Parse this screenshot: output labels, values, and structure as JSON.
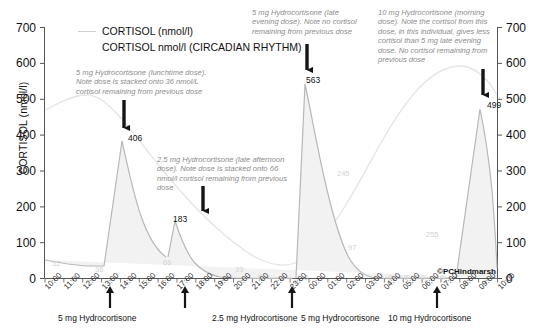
{
  "chart_data": {
    "type": "area",
    "title": "",
    "xlabel": "",
    "ylabel": "CORTISOL (nmol/l)",
    "ylim": [
      0,
      700
    ],
    "yticks": [
      0,
      100,
      200,
      300,
      400,
      500,
      600,
      700
    ],
    "yticks_right": [
      0,
      100,
      200,
      300,
      400,
      500,
      600,
      700
    ],
    "grid": false,
    "legend_position": "top-left",
    "x": [
      "10:00",
      "11:00",
      "12:00",
      "13:00",
      "14:00",
      "15:00",
      "16:00",
      "17:00",
      "18:00",
      "19:00",
      "20:00",
      "21:00",
      "22:00",
      "23:00",
      "00:00",
      "01:00",
      "02:00",
      "03:00",
      "04:00",
      "05:00",
      "06:00",
      "07:00",
      "08:00",
      "09:00",
      "10:00"
    ],
    "series": [
      {
        "name": "CORTISOL (nmol/l)",
        "color": "#bfbfbf",
        "fill": "#f0f0f0",
        "values": [
          52,
          40,
          36,
          36,
          406,
          230,
          130,
          66,
          183,
          120,
          70,
          33,
          10,
          0,
          563,
          330,
          245,
          97,
          20,
          0,
          0,
          0,
          499,
          300,
          180
        ]
      },
      {
        "name": "CORTISOL nmol/l (CIRCADIAN RHYTHM)",
        "color": "#e2e2e2",
        "values": [
          330,
          360,
          390,
          380,
          340,
          300,
          250,
          205,
          170,
          140,
          110,
          85,
          62,
          45,
          35,
          40,
          70,
          120,
          200,
          290,
          370,
          420,
          430,
          400,
          340
        ]
      }
    ],
    "point_labels": [
      {
        "value": "52",
        "x": 52,
        "y": 259
      },
      {
        "value": "36",
        "x": 95,
        "y": 265
      },
      {
        "value": "406",
        "x": 128,
        "y": 133
      },
      {
        "value": "66",
        "x": 163,
        "y": 258
      },
      {
        "value": "183",
        "x": 173,
        "y": 214
      },
      {
        "value": "33",
        "x": 235,
        "y": 265
      },
      {
        "value": "0",
        "x": 258,
        "y": 273
      },
      {
        "value": "0",
        "x": 281,
        "y": 273
      },
      {
        "value": "0",
        "x": 304,
        "y": 273
      },
      {
        "value": "563",
        "x": 306,
        "y": 75
      },
      {
        "value": "245",
        "x": 337,
        "y": 169
      },
      {
        "value": "97",
        "x": 348,
        "y": 243
      },
      {
        "value": "0",
        "x": 388,
        "y": 273
      },
      {
        "value": "0",
        "x": 404,
        "y": 273
      },
      {
        "value": "0",
        "x": 421,
        "y": 273
      },
      {
        "value": "255",
        "x": 426,
        "y": 230
      },
      {
        "value": "0",
        "x": 440,
        "y": 273
      },
      {
        "value": "499",
        "x": 487,
        "y": 100
      }
    ],
    "annotations": [
      {
        "id": "lunchtime",
        "text": "5 mg Hydrocortisone (lunchtime dose).\nNote dose is stacked onto 36 nmol/L\ncortisol remaining from previous dose"
      },
      {
        "id": "late-afternoon",
        "text": "2.5 mg Hydrocortisone (late afternoon\ndose). Note dose is stacked onto 66\nnmol/l cortisol remaining from previous\ndose"
      },
      {
        "id": "late-evening",
        "text": "5 mg Hydrocortisone (late\nevening dose). Note no cortisol\nremaining from previous dose"
      },
      {
        "id": "morning",
        "text": "10 mg Hydrocortisone (morning\ndose). Note the cortisol from this\ndose, in this individual, gives less\ncortisol than 5 mg late evening\ndose. No cortisol remaining from\nprevious dose"
      }
    ],
    "dose_markers": [
      {
        "label": "5 mg Hydrocortisone",
        "time": "13:00"
      },
      {
        "label": "2.5 mg Hydrocortisone",
        "time": "17:00"
      },
      {
        "label": "5 mg Hydrocortisone",
        "time": "23:00"
      },
      {
        "label": "10 mg Hydrocortisone",
        "time": "07:00"
      }
    ],
    "credit": "©PCHindmarsh"
  }
}
